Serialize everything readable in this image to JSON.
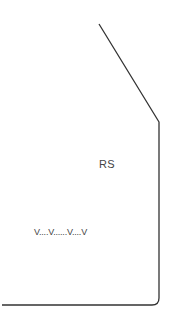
{
  "diagram": {
    "rs_label": "RS",
    "dotted_label": "V....V......V....V",
    "line_color": "#333333",
    "text_color": "#444444"
  }
}
